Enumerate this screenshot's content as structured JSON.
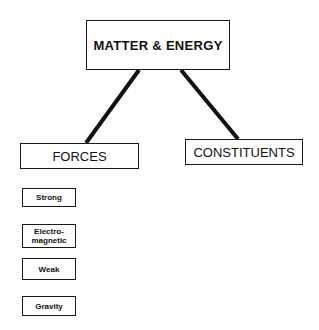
{
  "diagram": {
    "root": {
      "label": "MATTER & ENERGY"
    },
    "categories": [
      {
        "label": "FORCES"
      },
      {
        "label": "CONSTITUENTS"
      }
    ],
    "forces": [
      {
        "label": "Strong"
      },
      {
        "label": "Electro-\nmagnetic"
      },
      {
        "label": "Weak"
      },
      {
        "label": "Gravity"
      }
    ],
    "colors": {
      "line": "#111111",
      "border": "#1a1a1a",
      "background": "#ffffff"
    }
  }
}
